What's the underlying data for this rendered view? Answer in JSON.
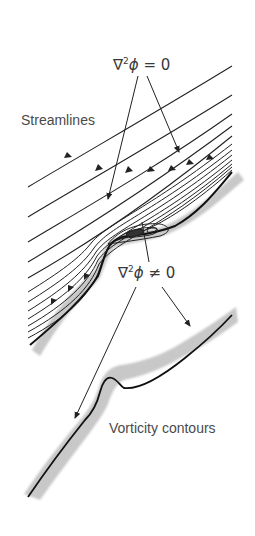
{
  "figure": {
    "labels": {
      "laplace_zero": {
        "nabla": "∇",
        "power": "2",
        "phi": "ϕ",
        "rest": " = 0"
      },
      "streamlines": "Streamlines",
      "laplace_nonzero": {
        "nabla": "∇",
        "power": "2",
        "phi": "ϕ",
        "rest": " ≠ 0"
      },
      "vorticity": "Vorticity contours"
    },
    "colors": {
      "line": "#222222",
      "wall_shade": "#c8c8c8",
      "text": "#444444",
      "background": "#ffffff"
    },
    "panels": [
      {
        "name": "streamline-panel",
        "description": "Flow streamlines over a curved wall with a recirculation bubble"
      },
      {
        "name": "vorticity-panel",
        "description": "Vorticity contours confined to thin layer along wall"
      }
    ]
  }
}
